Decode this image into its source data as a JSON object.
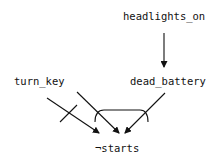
{
  "nodes": {
    "headlights_on": "headlights_on",
    "dead_battery": "dead_battery",
    "turn_key": "turn_key",
    "not_starts": "¬starts"
  },
  "edges": [
    {
      "from": "headlights_on",
      "to": "dead_battery",
      "type": "cause"
    },
    {
      "from": "turn_key",
      "to": "not_starts",
      "type": "negated",
      "marker": "crossbar"
    },
    {
      "from": "turn_key",
      "to": "not_starts",
      "type": "joint-cause",
      "group": "conjunction-arc"
    },
    {
      "from": "dead_battery",
      "to": "not_starts",
      "type": "joint-cause",
      "group": "conjunction-arc"
    }
  ],
  "colors": {
    "line": "#111111",
    "background": "#ffffff"
  }
}
